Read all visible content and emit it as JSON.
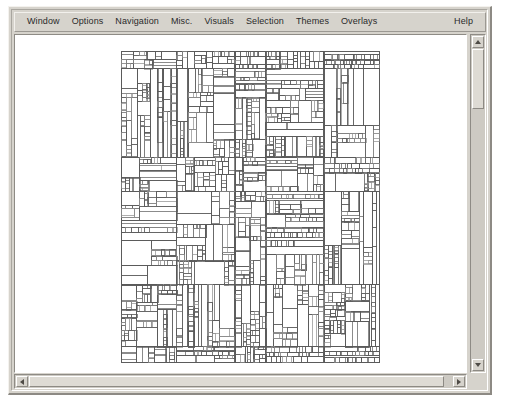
{
  "window": {
    "title": "Treemap Viewer",
    "frame_color": "#d6d3cc",
    "canvas_color": "#ffffff"
  },
  "menubar": {
    "items": [
      {
        "label": "Window"
      },
      {
        "label": "Options"
      },
      {
        "label": "Navigation"
      },
      {
        "label": "Misc."
      },
      {
        "label": "Visuals"
      },
      {
        "label": "Selection"
      },
      {
        "label": "Themes"
      },
      {
        "label": "Overlays"
      }
    ],
    "help_label": "Help"
  },
  "scrollbars": {
    "vertical": {
      "up_icon": "triangle-up-icon",
      "down_icon": "triangle-down-icon",
      "thumb_position_pct": 0,
      "thumb_size_pct": 18
    },
    "horizontal": {
      "left_icon": "triangle-left-icon",
      "right_icon": "triangle-right-icon",
      "thumb_position_pct": 0,
      "thumb_size_pct": 95
    }
  },
  "chart_data": {
    "type": "treemap",
    "title": "",
    "xlabel": "",
    "ylabel": "",
    "layout": {
      "origin_x": 106,
      "origin_y": 16,
      "width": 258,
      "height": 311,
      "grid": false,
      "legend": "none"
    },
    "style": {
      "stroke": "#5a5a5a",
      "stroke_light": "#8d8d8d",
      "stroke_width": 0.7,
      "fill": "none",
      "background": "#ffffff"
    },
    "generator": {
      "seed": 20250413,
      "max_depth": 7,
      "min_cell_w": 3.2,
      "min_cell_h": 3.2,
      "split_ratio_min": 0.22,
      "split_ratio_max": 0.78,
      "horizontal_bias": 0.56,
      "prune_probability": 0.1,
      "leaf_stop_probability": 0.18
    },
    "root_columns": [
      0.215,
      0.225,
      0.12,
      0.225,
      0.215
    ],
    "root_rows": [
      0.055,
      0.285,
      0.11,
      0.3,
      0.2,
      0.05
    ],
    "cell_count_estimate": 1240
  }
}
